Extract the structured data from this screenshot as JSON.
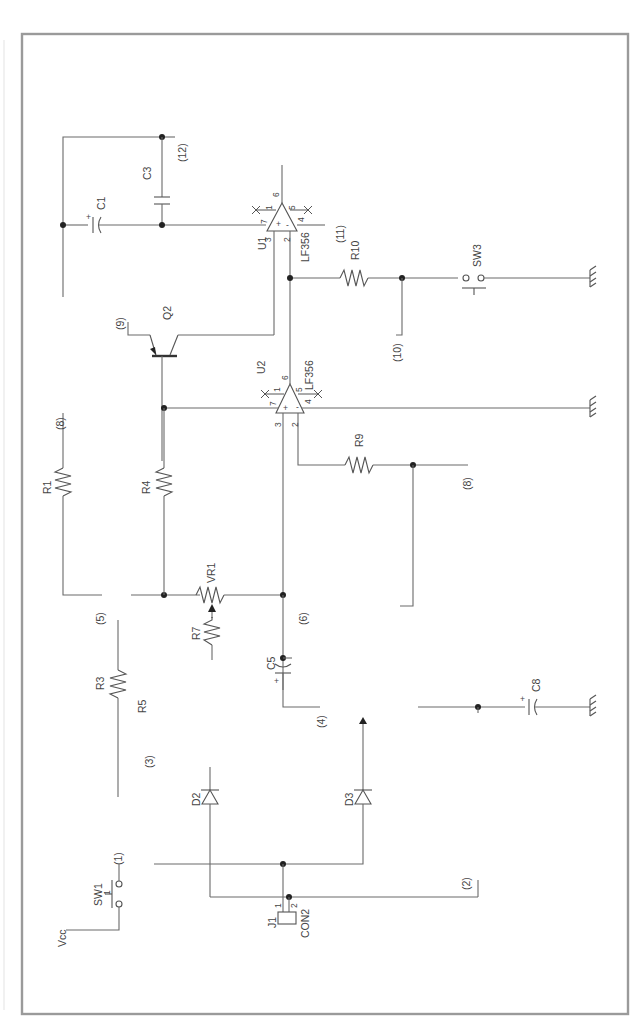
{
  "diagram": {
    "type": "electronic-schematic",
    "orientation": "rotated-90",
    "frame_color": "#9a9a9a",
    "wire_color": "#6a6a6a"
  },
  "components": {
    "u1": {
      "ref": "U1",
      "part": "LF356",
      "pins": {
        "p1": "1",
        "p2": "2",
        "p3": "3",
        "p4": "4",
        "p5": "5",
        "p6": "6",
        "p7": "7"
      },
      "plus": "+",
      "minus": "-"
    },
    "u2": {
      "ref": "U2",
      "part": "LF356",
      "pins": {
        "p1": "1",
        "p2": "2",
        "p3": "3",
        "p4": "4",
        "p5": "5",
        "p6": "6",
        "p7": "7"
      },
      "plus": "+",
      "minus": "-"
    },
    "q2": {
      "ref": "Q2"
    },
    "c1": {
      "ref": "C1",
      "polarity": "+"
    },
    "c3": {
      "ref": "C3"
    },
    "c5": {
      "ref": "C5",
      "polarity": "+"
    },
    "c8": {
      "ref": "C8",
      "polarity": "+"
    },
    "r1": {
      "ref": "R1"
    },
    "r3": {
      "ref": "R3"
    },
    "r4": {
      "ref": "R4"
    },
    "r5": {
      "ref": "R5"
    },
    "r7": {
      "ref": "R7"
    },
    "r9": {
      "ref": "R9"
    },
    "r10": {
      "ref": "R10"
    },
    "vr1": {
      "ref": "VR1"
    },
    "d2": {
      "ref": "D2"
    },
    "d3": {
      "ref": "D3"
    },
    "sw1": {
      "ref": "SW1",
      "pin": "1"
    },
    "sw3": {
      "ref": "SW3"
    },
    "j1": {
      "ref": "J1",
      "part": "CON2",
      "pin1": "1",
      "pin2": "2"
    },
    "vcc": {
      "label": "Vcc"
    }
  },
  "nodes": [
    "(1)",
    "(2)",
    "(3)",
    "(4)",
    "(5)",
    "(6)",
    "(7)",
    "(8)",
    "(9)",
    "(10)",
    "(11)",
    "(12)"
  ]
}
